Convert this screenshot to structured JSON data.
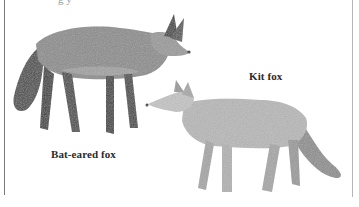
{
  "caption_fragment": "g y",
  "labels": {
    "kit_fox": "Kit fox",
    "bat_eared_fox": "Bat-eared fox"
  },
  "figures": [
    {
      "name": "Bat-eared fox",
      "description": "Dark grizzled grey fox with very large ears, bushy dark tail, facing right"
    },
    {
      "name": "Kit fox",
      "description": "Pale grey fox with large ears and bushy tail, facing left"
    }
  ],
  "colors": {
    "background": "#ffffff",
    "frame_line": "#7a7a7a",
    "label_text": "#2a2a2a",
    "bat_fox_body": "#8a8a8a",
    "bat_fox_dark": "#3a3a3a",
    "kit_fox_body": "#b8b8b8",
    "kit_fox_shade": "#8c8c8c"
  }
}
